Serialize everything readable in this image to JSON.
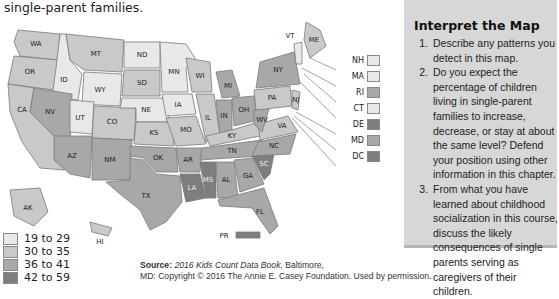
{
  "caption": "single-parent families.",
  "panel": {
    "title": "Interpret the Map",
    "questions": [
      "Describe any patterns you detect in this map.",
      "Do you expect the percentage of children living in single-parent families to increase, decrease, or stay at about the same level? Defend your position using other information in this chapter.",
      "From what you have learned about childhood socialization in this course, discuss the likely consequences of single parents serving as caregivers of their children."
    ]
  },
  "legend": {
    "items": [
      {
        "label": "19 to 29",
        "color": "#e8e8e8"
      },
      {
        "label": "30 to 35",
        "color": "#c9c9c9"
      },
      {
        "label": "36 to 41",
        "color": "#a8a8a8"
      },
      {
        "label": "42 to 59",
        "color": "#7e7e7e"
      }
    ]
  },
  "source": {
    "label": "Source:",
    "book": "2016 Kids Count Data Book,",
    "line1_rest": " Baltimore,",
    "line2": "MD: Copyright © 2016 The Annie E. Casey Foundation. Used by permission."
  },
  "northeast_callouts": [
    {
      "state": "NH",
      "bin": 0
    },
    {
      "state": "MA",
      "bin": 0
    },
    {
      "state": "RI",
      "bin": 2
    },
    {
      "state": "CT",
      "bin": 0
    },
    {
      "state": "DE",
      "bin": 3
    },
    {
      "state": "MD",
      "bin": 2
    },
    {
      "state": "DC",
      "bin": 3
    }
  ],
  "states": {
    "WA": 1,
    "OR": 1,
    "CA": 1,
    "ID": 0,
    "NV": 2,
    "MT": 1,
    "WY": 0,
    "UT": 0,
    "CO": 1,
    "AZ": 2,
    "NM": 2,
    "ND": 0,
    "SD": 1,
    "NE": 0,
    "KS": 1,
    "OK": 2,
    "TX": 2,
    "MN": 0,
    "IA": 0,
    "MO": 1,
    "AR": 2,
    "LA": 3,
    "WI": 1,
    "IL": 1,
    "MI": 2,
    "IN": 2,
    "OH": 2,
    "KY": 1,
    "TN": 2,
    "MS": 3,
    "AL": 2,
    "GA": 2,
    "FL": 2,
    "SC": 3,
    "NC": 2,
    "VA": 1,
    "WV": 2,
    "PA": 1,
    "NY": 2,
    "VT": 0,
    "ME": 1,
    "NJ": 1,
    "AK": 1,
    "HI": 1,
    "PR": 3
  }
}
